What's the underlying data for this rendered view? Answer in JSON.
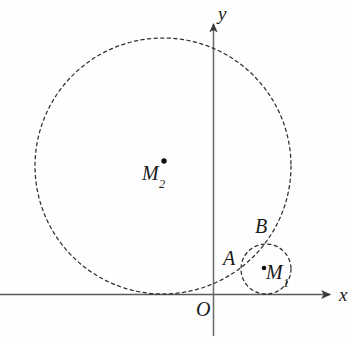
{
  "figure": {
    "type": "geometry-diagram",
    "background_color": "#fefefe",
    "stroke_color": "#2b2b2b",
    "axis_color": "#555555",
    "labels": {
      "axis_x": "x",
      "axis_y": "y",
      "origin": "O",
      "point_a": "A",
      "point_b": "B",
      "center_1_base": "M",
      "center_1_sub": "1",
      "center_2_base": "M",
      "center_2_sub": "2"
    }
  },
  "chart_data": {
    "type": "scatter",
    "title": "",
    "xlabel": "x",
    "ylabel": "y",
    "grid": false,
    "legend": null,
    "axes": {
      "x_axis": {
        "label": "x",
        "y_pixel": 294,
        "x_start": 0,
        "x_end": 337,
        "arrow": "right"
      },
      "y_axis": {
        "label": "y",
        "x_pixel": 213,
        "y_start": 336,
        "y_end": 18,
        "arrow": "up"
      },
      "origin_label": "O"
    },
    "circles": [
      {
        "name": "M2",
        "label": "M",
        "subscript": "2",
        "center_px": [
          163,
          166
        ],
        "radius_px": 128,
        "style": "dashed",
        "tangent_to": "x-axis",
        "center_marker": true
      },
      {
        "name": "M1",
        "label": "M",
        "subscript": "1",
        "center_px": [
          266,
          269
        ],
        "radius_px": 25,
        "style": "dashed",
        "tangent_to": "x-axis",
        "center_marker": true
      }
    ],
    "points": [
      {
        "label": "A",
        "px": [
          243,
          263
        ],
        "note": "lower intersection of the two circles"
      },
      {
        "label": "B",
        "px": [
          268,
          244
        ],
        "note": "upper intersection of the two circles"
      },
      {
        "label": "O",
        "px": [
          213,
          294
        ],
        "note": "origin"
      }
    ]
  }
}
